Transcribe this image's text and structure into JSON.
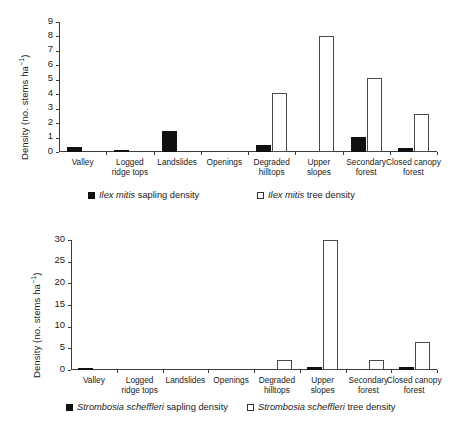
{
  "figure": {
    "width": 457,
    "height": 421,
    "background": "#ffffff",
    "bar_fill_sapling": "#111111",
    "bar_fill_tree": "#ffffff",
    "axis_color": "#3c3c3c"
  },
  "categories": [
    "Valley",
    "Logged ridge tops",
    "Landslides",
    "Openings",
    "Degraded hilltops",
    "Upper slopes",
    "Secondary forest",
    "Closed canopy forest"
  ],
  "category_lines": [
    [
      "Valley"
    ],
    [
      "Logged",
      "ridge tops"
    ],
    [
      "Landslides"
    ],
    [
      "Openings"
    ],
    [
      "Degraded",
      "hilltops"
    ],
    [
      "Upper",
      "slopes"
    ],
    [
      "Secondary",
      "forest"
    ],
    [
      "Closed canopy",
      "forest"
    ]
  ],
  "panels": {
    "top": {
      "ylabel_main": "Density (no. stems ha",
      "ylabel_sup": "−1",
      "ylabel_close": ")",
      "yticks": [
        0,
        1,
        2,
        3,
        4,
        5,
        6,
        7,
        8,
        9
      ],
      "legend": [
        {
          "marker": "filled",
          "species": "Ilex mitis",
          "rest": " sapling density"
        },
        {
          "marker": "hollow",
          "species": "Ilex mitis",
          "rest": " tree density"
        }
      ]
    },
    "bottom": {
      "ylabel_main": "Density (no. stems ha",
      "ylabel_sup": "−1",
      "ylabel_close": ")",
      "yticks": [
        0,
        5,
        10,
        15,
        20,
        25,
        30
      ],
      "legend": [
        {
          "marker": "filled",
          "species": "Strombosia scheffleri",
          "rest": " sapling density"
        },
        {
          "marker": "hollow",
          "species": "Strombosia scheffleri",
          "rest": " tree density"
        }
      ]
    }
  },
  "chart_data": [
    {
      "type": "bar",
      "title": "Ilex mitis density by habitat",
      "xlabel": "",
      "ylabel": "Density (no. stems ha-1)",
      "ylim": [
        0,
        9
      ],
      "ytick_step": 1,
      "grid": false,
      "legend_position": "bottom",
      "categories": [
        "Valley",
        "Logged ridge tops",
        "Landslides",
        "Openings",
        "Degraded hilltops",
        "Upper slopes",
        "Secondary forest",
        "Closed canopy forest"
      ],
      "series": [
        {
          "name": "Ilex mitis sapling density",
          "fill": "#111111",
          "values": [
            0.35,
            0.15,
            1.45,
            0,
            0.5,
            0,
            1.05,
            0.3
          ]
        },
        {
          "name": "Ilex mitis tree density",
          "fill": "#ffffff",
          "values": [
            0,
            0,
            0,
            0,
            4.1,
            8.05,
            5.1,
            2.65
          ]
        }
      ]
    },
    {
      "type": "bar",
      "title": "Strombosia scheffleri density by habitat",
      "xlabel": "",
      "ylabel": "Density (no. stems ha-1)",
      "ylim": [
        0,
        30
      ],
      "ytick_step": 5,
      "grid": false,
      "legend_position": "bottom",
      "categories": [
        "Valley",
        "Logged ridge tops",
        "Landslides",
        "Openings",
        "Degraded hilltops",
        "Upper slopes",
        "Secondary forest",
        "Closed canopy forest"
      ],
      "series": [
        {
          "name": "Strombosia scheffleri sapling density",
          "fill": "#111111",
          "values": [
            0.4,
            0,
            0,
            0,
            0,
            0.6,
            0,
            0.8
          ]
        },
        {
          "name": "Strombosia scheffleri tree density",
          "fill": "#ffffff",
          "values": [
            0,
            0,
            0,
            0,
            2.4,
            30,
            2.3,
            6.5
          ]
        }
      ]
    }
  ]
}
